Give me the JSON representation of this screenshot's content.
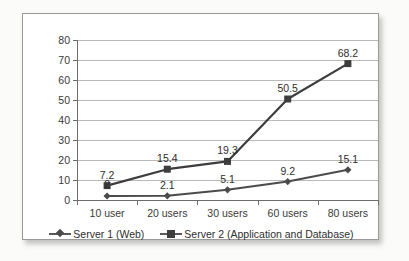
{
  "chart_data": {
    "type": "line",
    "title": "",
    "xlabel": "",
    "ylabel": "",
    "categories": [
      "10 user",
      "20 users",
      "30 users",
      "60 users",
      "80 users"
    ],
    "ylim": [
      0,
      80
    ],
    "yticks": [
      0,
      10,
      20,
      30,
      40,
      50,
      60,
      70,
      80
    ],
    "grid": true,
    "legend_position": "bottom",
    "series": [
      {
        "name": "Server 1 (Web)",
        "marker": "diamond",
        "color": "#4b4b4b",
        "values": [
          2,
          2.1,
          5.1,
          9.2,
          15.1
        ],
        "labels": [
          "2",
          "2.1",
          "5.1",
          "9.2",
          "15.1"
        ]
      },
      {
        "name": "Server 2 (Application and Database)",
        "marker": "square",
        "color": "#3d3d3d",
        "values": [
          7.2,
          15.4,
          19.3,
          50.5,
          68.2
        ],
        "labels": [
          "7.2",
          "15.4",
          "19.3",
          "50.5",
          "68.2"
        ]
      }
    ]
  },
  "legend": {
    "entries": [
      {
        "label": "Server 1 (Web)"
      },
      {
        "label": "Server 2 (Application and Database)"
      }
    ]
  },
  "colors": {
    "series1": "#4b4b4b",
    "series2": "#3d3d3d",
    "gridline": "#b9b9b9",
    "axis": "#6d6d6d",
    "frame": "#9a9a9a",
    "text": "#2e2e2e",
    "background": "#ffffff"
  }
}
